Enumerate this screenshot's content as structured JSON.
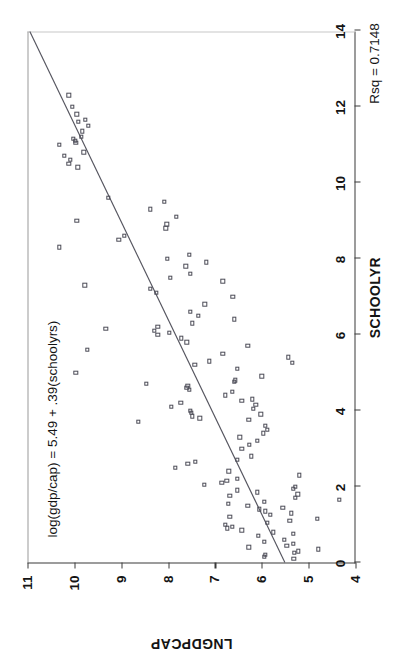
{
  "figure": {
    "rotation_degrees": -90,
    "background": "#ffffff",
    "marker_color": "#4b4b56",
    "axis_color": "#3a3a3a",
    "line_color": "#55555f"
  },
  "chart_data": {
    "type": "scatter",
    "title": "",
    "xlabel": "SCHOOLYR",
    "ylabel": "LNGDPCAP",
    "xlim": [
      0,
      14
    ],
    "ylim": [
      4,
      11
    ],
    "xticks": [
      0,
      2,
      4,
      6,
      8,
      10,
      12,
      14
    ],
    "yticks": [
      4,
      5,
      6,
      7,
      8,
      9,
      10,
      11
    ],
    "xticklabels": [
      "0",
      "2",
      "4",
      "6",
      "8",
      "10",
      "12",
      "14"
    ],
    "yticklabels": [
      "4",
      "5",
      "6",
      "7",
      "8",
      "9",
      "10",
      "11"
    ],
    "grid": false,
    "legend": null,
    "annotations": [
      {
        "name": "regression-equation",
        "text": "log(gdp/cap) = 5.49 + .39(schoolyrs)",
        "x": 0.7,
        "y": 10.55
      },
      {
        "name": "r-squared",
        "text": "Rsq = 0.7148",
        "x": 13.2,
        "y": 3.45
      }
    ],
    "fit_line": {
      "name": "ols-regression-line",
      "equation": "log(gdp/cap) = 5.49 + .39(schoolyrs)",
      "intercept": 5.49,
      "slope": 0.39,
      "r_squared": 0.7148,
      "x_start": 0.0,
      "x_end": 14.0,
      "y_start": 5.49,
      "y_end": 10.95
    },
    "series": [
      {
        "name": "countries",
        "marker": "open-square",
        "points": [
          [
            0.1,
            5.32
          ],
          [
            0.15,
            5.95
          ],
          [
            0.2,
            5.93
          ],
          [
            0.25,
            5.3
          ],
          [
            0.3,
            5.22
          ],
          [
            0.35,
            4.8
          ],
          [
            0.4,
            6.28
          ],
          [
            0.45,
            5.47
          ],
          [
            0.5,
            5.33
          ],
          [
            0.55,
            5.95
          ],
          [
            0.6,
            5.52
          ],
          [
            0.7,
            6.07
          ],
          [
            0.75,
            5.33
          ],
          [
            0.8,
            5.75
          ],
          [
            0.85,
            6.43
          ],
          [
            0.9,
            6.73
          ],
          [
            0.95,
            6.63
          ],
          [
            1.0,
            6.78
          ],
          [
            1.05,
            5.88
          ],
          [
            1.1,
            5.4
          ],
          [
            1.15,
            4.82
          ],
          [
            1.2,
            6.68
          ],
          [
            1.25,
            5.82
          ],
          [
            1.3,
            5.37
          ],
          [
            1.35,
            5.93
          ],
          [
            1.4,
            6.05
          ],
          [
            1.45,
            5.55
          ],
          [
            1.5,
            6.3
          ],
          [
            1.55,
            6.72
          ],
          [
            1.6,
            5.95
          ],
          [
            1.65,
            4.35
          ],
          [
            1.7,
            5.28
          ],
          [
            1.75,
            6.68
          ],
          [
            1.8,
            5.23
          ],
          [
            1.85,
            6.1
          ],
          [
            1.9,
            6.52
          ],
          [
            1.95,
            5.33
          ],
          [
            2.0,
            5.28
          ],
          [
            2.05,
            7.23
          ],
          [
            2.1,
            6.85
          ],
          [
            2.15,
            6.75
          ],
          [
            2.2,
            6.52
          ],
          [
            2.3,
            5.2
          ],
          [
            2.4,
            6.7
          ],
          [
            2.5,
            7.85
          ],
          [
            2.6,
            7.58
          ],
          [
            2.65,
            7.42
          ],
          [
            2.7,
            6.52
          ],
          [
            2.8,
            6.22
          ],
          [
            3.0,
            6.43
          ],
          [
            3.1,
            6.27
          ],
          [
            3.2,
            6.1
          ],
          [
            3.3,
            6.47
          ],
          [
            3.4,
            5.97
          ],
          [
            3.5,
            5.88
          ],
          [
            3.6,
            5.92
          ],
          [
            3.7,
            8.63
          ],
          [
            3.75,
            6.28
          ],
          [
            3.8,
            7.32
          ],
          [
            3.85,
            7.48
          ],
          [
            3.9,
            6.02
          ],
          [
            3.95,
            7.5
          ],
          [
            4.0,
            7.52
          ],
          [
            4.05,
            6.18
          ],
          [
            4.1,
            7.93
          ],
          [
            4.15,
            6.13
          ],
          [
            4.2,
            7.73
          ],
          [
            4.25,
            6.43
          ],
          [
            4.3,
            6.2
          ],
          [
            4.4,
            6.78
          ],
          [
            4.5,
            6.63
          ],
          [
            4.55,
            7.55
          ],
          [
            4.6,
            7.6
          ],
          [
            4.65,
            7.58
          ],
          [
            4.7,
            8.47
          ],
          [
            4.75,
            6.58
          ],
          [
            4.8,
            6.57
          ],
          [
            4.9,
            6.0
          ],
          [
            5.0,
            9.97
          ],
          [
            5.1,
            6.52
          ],
          [
            5.2,
            7.43
          ],
          [
            5.25,
            5.35
          ],
          [
            5.3,
            7.12
          ],
          [
            5.4,
            5.43
          ],
          [
            5.5,
            6.83
          ],
          [
            5.6,
            9.72
          ],
          [
            5.7,
            6.3
          ],
          [
            5.8,
            7.6
          ],
          [
            5.9,
            7.72
          ],
          [
            6.0,
            8.22
          ],
          [
            6.05,
            7.98
          ],
          [
            6.1,
            8.3
          ],
          [
            6.15,
            9.33
          ],
          [
            6.2,
            8.22
          ],
          [
            6.3,
            7.48
          ],
          [
            6.4,
            6.58
          ],
          [
            6.5,
            7.35
          ],
          [
            6.6,
            7.52
          ],
          [
            6.8,
            7.22
          ],
          [
            7.0,
            6.62
          ],
          [
            7.1,
            8.25
          ],
          [
            7.2,
            8.38
          ],
          [
            7.3,
            9.78
          ],
          [
            7.4,
            6.83
          ],
          [
            7.5,
            7.95
          ],
          [
            7.6,
            7.52
          ],
          [
            7.8,
            7.62
          ],
          [
            7.9,
            7.18
          ],
          [
            8.0,
            8.02
          ],
          [
            8.1,
            7.55
          ],
          [
            8.3,
            10.32
          ],
          [
            8.5,
            9.05
          ],
          [
            8.6,
            8.93
          ],
          [
            8.8,
            8.05
          ],
          [
            8.9,
            8.03
          ],
          [
            9.0,
            9.95
          ],
          [
            9.1,
            7.82
          ],
          [
            9.3,
            8.38
          ],
          [
            9.5,
            8.08
          ],
          [
            9.6,
            9.27
          ],
          [
            10.4,
            9.93
          ],
          [
            10.5,
            10.12
          ],
          [
            10.6,
            10.08
          ],
          [
            10.7,
            10.22
          ],
          [
            10.8,
            9.8
          ],
          [
            11.0,
            10.32
          ],
          [
            11.05,
            9.97
          ],
          [
            11.1,
            9.98
          ],
          [
            11.15,
            10.02
          ],
          [
            11.2,
            9.85
          ],
          [
            11.35,
            9.83
          ],
          [
            11.5,
            9.7
          ],
          [
            11.6,
            9.92
          ],
          [
            11.65,
            9.77
          ],
          [
            11.8,
            9.95
          ],
          [
            12.0,
            10.05
          ],
          [
            12.3,
            10.12
          ]
        ]
      }
    ]
  }
}
